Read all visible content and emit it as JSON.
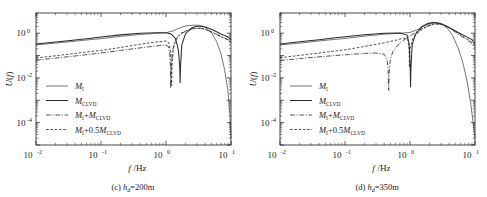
{
  "figure": {
    "background": "#ffffff",
    "ink_color": "#1a1a1a"
  },
  "chart_data": [
    {
      "type": "line",
      "panel_id": "c",
      "title": "",
      "caption_prefix": "(c)",
      "caption_symbol": "h",
      "caption_subscript": "d",
      "caption_value": "=200m",
      "caption_full": "(c) h_d=200m",
      "xlabel": "f/Hz",
      "xlabel_italic": "f",
      "xlabel_unit": "/Hz",
      "ylabel": "U(f)",
      "xscale": "log",
      "yscale": "log",
      "xlim": [
        0.01,
        10
      ],
      "ylim": [
        1e-05,
        8
      ],
      "xticks": [
        0.01,
        0.1,
        1,
        10
      ],
      "xtick_labels": [
        "10^-2",
        "10^-1",
        "10^0",
        "10^1"
      ],
      "xtick_mantissa": "10",
      "xtick_exponents": [
        "-2",
        "-1",
        "0",
        "1"
      ],
      "yticks": [
        1,
        0.01,
        0.0001
      ],
      "ytick_labels": [
        "10^0",
        "10^-2",
        "10^-4"
      ],
      "ytick_mantissa": "10",
      "ytick_exponents": [
        "0",
        "-2",
        "-4"
      ],
      "grid": false,
      "legend_position": "lower left",
      "notch_frequencies": {
        "M_CLVD": 1.65,
        "M_I_plus_M_CLVD": 1.18,
        "M_I_plus_half_M_CLVD": 1.22
      },
      "series": [
        {
          "name": "M_I",
          "label_base": "M",
          "label_sub": "I",
          "style": "solid-thin",
          "x": [
            0.01,
            0.02,
            0.04,
            0.07,
            0.1,
            0.2,
            0.4,
            0.7,
            1.0,
            1.3,
            1.6,
            2.0,
            2.5,
            3.0,
            3.5,
            4.0,
            5.0,
            6.0,
            7.0,
            8.0,
            9.0,
            9.6,
            10.0
          ],
          "y": [
            0.3,
            0.36,
            0.44,
            0.52,
            0.57,
            0.72,
            0.88,
            0.98,
            1.05,
            1.28,
            1.7,
            2.1,
            2.25,
            2.3,
            2.15,
            1.85,
            1.05,
            0.42,
            0.12,
            0.022,
            0.0025,
            0.00022,
            2e-05
          ]
        },
        {
          "name": "M_CLVD",
          "label_base": "M",
          "label_sub": "CLVD",
          "style": "solid-thick",
          "x": [
            0.01,
            0.02,
            0.04,
            0.07,
            0.1,
            0.2,
            0.4,
            0.7,
            1.0,
            1.2,
            1.4,
            1.55,
            1.63,
            1.65,
            1.67,
            1.75,
            2.0,
            2.5,
            3.0,
            3.5,
            4.0,
            5.0,
            6.0,
            7.0,
            8.0,
            9.0,
            10.0
          ],
          "y": [
            0.33,
            0.4,
            0.5,
            0.6,
            0.67,
            0.84,
            0.99,
            1.05,
            1.05,
            0.92,
            0.58,
            0.18,
            0.03,
            0.006,
            0.03,
            0.3,
            0.95,
            1.75,
            2.05,
            2.05,
            1.9,
            1.5,
            1.15,
            0.92,
            0.78,
            0.68,
            0.5
          ]
        },
        {
          "name": "M_I+M_CLVD",
          "label_base": "M",
          "label_sub": "I",
          "label_mid": "+M",
          "label_sub2": "CLVD",
          "style": "dash-dot",
          "x": [
            0.01,
            0.02,
            0.04,
            0.07,
            0.1,
            0.2,
            0.4,
            0.7,
            0.9,
            1.0,
            1.08,
            1.14,
            1.17,
            1.18,
            1.2,
            1.26,
            1.4,
            1.7,
            2.0,
            2.5,
            3.0,
            3.5,
            4.0,
            5.0,
            6.0,
            7.0,
            8.0,
            9.0,
            10.0
          ],
          "y": [
            0.062,
            0.077,
            0.096,
            0.115,
            0.13,
            0.17,
            0.22,
            0.27,
            0.29,
            0.295,
            0.26,
            0.13,
            0.03,
            0.0035,
            0.03,
            0.17,
            0.5,
            0.95,
            1.2,
            1.55,
            1.7,
            1.66,
            1.5,
            1.15,
            0.9,
            0.72,
            0.6,
            0.52,
            0.4
          ]
        },
        {
          "name": "M_I+0.5M_CLVD",
          "label_base": "M",
          "label_sub": "I",
          "label_mid": "+0.5M",
          "label_sub2": "CLVD",
          "style": "dashed",
          "x": [
            0.01,
            0.02,
            0.04,
            0.07,
            0.1,
            0.2,
            0.4,
            0.7,
            0.9,
            1.0,
            1.1,
            1.17,
            1.21,
            1.22,
            1.24,
            1.3,
            1.45,
            1.7,
            2.0,
            2.5,
            3.0,
            3.5,
            4.0,
            5.0,
            6.0,
            7.0,
            8.0,
            9.0,
            10.0
          ],
          "y": [
            0.077,
            0.098,
            0.125,
            0.152,
            0.17,
            0.23,
            0.32,
            0.4,
            0.44,
            0.45,
            0.38,
            0.17,
            0.035,
            0.0045,
            0.035,
            0.22,
            0.6,
            1.0,
            1.25,
            1.55,
            1.68,
            1.62,
            1.48,
            1.12,
            0.88,
            0.7,
            0.58,
            0.5,
            0.38
          ]
        }
      ]
    },
    {
      "type": "line",
      "panel_id": "d",
      "title": "",
      "caption_prefix": "(d)",
      "caption_symbol": "h",
      "caption_subscript": "d",
      "caption_value": "=350m",
      "caption_full": "(d) h_d=350m",
      "xlabel": "f/Hz",
      "xlabel_italic": "f",
      "xlabel_unit": "/Hz",
      "ylabel": "U(f)",
      "xscale": "log",
      "yscale": "log",
      "xlim": [
        0.01,
        10
      ],
      "ylim": [
        1e-05,
        8
      ],
      "xticks": [
        0.01,
        0.1,
        1,
        10
      ],
      "xtick_labels": [
        "10^-2",
        "10^-1",
        "10^0",
        "10^1"
      ],
      "xtick_mantissa": "10",
      "xtick_exponents": [
        "-2",
        "-1",
        "0",
        "1"
      ],
      "yticks": [
        1,
        0.01,
        0.0001
      ],
      "ytick_labels": [
        "10^0",
        "10^-2",
        "10^-4"
      ],
      "ytick_mantissa": "10",
      "ytick_exponents": [
        "0",
        "-2",
        "-4"
      ],
      "grid": false,
      "legend_position": "lower left",
      "notch_frequencies": {
        "M_CLVD": 1.02,
        "M_I_plus_M_CLVD": 0.47,
        "M_I_plus_half_M_CLVD": 0.98
      },
      "series": [
        {
          "name": "M_I",
          "label_base": "M",
          "label_sub": "I",
          "style": "solid-thin",
          "x": [
            0.01,
            0.02,
            0.04,
            0.07,
            0.1,
            0.2,
            0.4,
            0.7,
            1.0,
            1.3,
            1.6,
            2.0,
            2.4,
            2.8,
            3.2,
            3.8,
            4.5,
            5.5,
            6.5,
            7.5,
            8.5,
            9.3,
            10.0
          ],
          "y": [
            0.3,
            0.36,
            0.45,
            0.53,
            0.58,
            0.74,
            0.9,
            1.0,
            1.08,
            1.45,
            2.0,
            2.6,
            2.9,
            2.8,
            2.4,
            1.6,
            0.8,
            0.22,
            0.048,
            0.008,
            0.0009,
            0.00012,
            2e-05
          ]
        },
        {
          "name": "M_CLVD",
          "label_base": "M",
          "label_sub": "CLVD",
          "style": "solid-thick",
          "x": [
            0.01,
            0.02,
            0.04,
            0.07,
            0.1,
            0.2,
            0.4,
            0.7,
            0.9,
            0.97,
            1.01,
            1.02,
            1.03,
            1.08,
            1.2,
            1.5,
            1.9,
            2.3,
            2.7,
            3.1,
            3.6,
            4.2,
            5.0,
            6.0,
            7.0,
            8.0,
            9.0,
            10.0
          ],
          "y": [
            0.33,
            0.41,
            0.51,
            0.62,
            0.69,
            0.86,
            1.0,
            1.03,
            0.82,
            0.33,
            0.022,
            0.0038,
            0.022,
            0.3,
            0.85,
            1.9,
            2.75,
            3.0,
            2.85,
            2.55,
            2.1,
            1.65,
            1.25,
            0.95,
            0.76,
            0.62,
            0.52,
            0.32
          ]
        },
        {
          "name": "M_I+M_CLVD",
          "label_base": "M",
          "label_sub": "I",
          "label_mid": "+M",
          "label_sub2": "CLVD",
          "style": "dash-dot",
          "x": [
            0.01,
            0.02,
            0.04,
            0.07,
            0.1,
            0.2,
            0.3,
            0.4,
            0.44,
            0.46,
            0.47,
            0.48,
            0.5,
            0.55,
            0.7,
            0.9,
            1.2,
            1.6,
            2.0,
            2.4,
            2.8,
            3.2,
            3.8,
            4.5,
            5.5,
            6.5,
            7.5,
            8.5,
            10.0
          ],
          "y": [
            0.06,
            0.073,
            0.088,
            0.1,
            0.108,
            0.125,
            0.13,
            0.115,
            0.075,
            0.028,
            0.0028,
            0.022,
            0.07,
            0.16,
            0.37,
            0.62,
            1.05,
            1.7,
            2.25,
            2.6,
            2.6,
            2.4,
            1.9,
            1.4,
            0.92,
            0.66,
            0.5,
            0.4,
            0.22
          ]
        },
        {
          "name": "M_I+0.5M_CLVD",
          "label_base": "M",
          "label_sub": "I",
          "label_mid": "+0.5M",
          "label_sub2": "CLVD",
          "style": "dashed",
          "x": [
            0.01,
            0.02,
            0.04,
            0.07,
            0.1,
            0.2,
            0.4,
            0.6,
            0.8,
            0.92,
            0.97,
            0.98,
            1.0,
            1.1,
            1.3,
            1.6,
            2.0,
            2.4,
            2.8,
            3.2,
            3.8,
            4.5,
            5.5,
            6.5,
            7.5,
            8.5,
            10.0
          ],
          "y": [
            0.08,
            0.102,
            0.13,
            0.16,
            0.18,
            0.255,
            0.37,
            0.48,
            0.6,
            0.56,
            0.2,
            0.03,
            0.2,
            0.56,
            1.0,
            1.6,
            2.2,
            2.55,
            2.55,
            2.35,
            1.9,
            1.45,
            1.0,
            0.74,
            0.57,
            0.46,
            0.28
          ]
        }
      ]
    }
  ],
  "legend": {
    "entries": [
      {
        "style": "solid-thin",
        "base": "M",
        "sub": "I",
        "mid": "",
        "sub2": ""
      },
      {
        "style": "solid-thick",
        "base": "M",
        "sub": "CLVD",
        "mid": "",
        "sub2": ""
      },
      {
        "style": "dash-dot",
        "base": "M",
        "sub": "I",
        "mid": "+M",
        "sub2": "CLVD"
      },
      {
        "style": "dashed",
        "base": "M",
        "sub": "I",
        "mid": "+0.5M",
        "sub2": "CLVD"
      }
    ]
  }
}
